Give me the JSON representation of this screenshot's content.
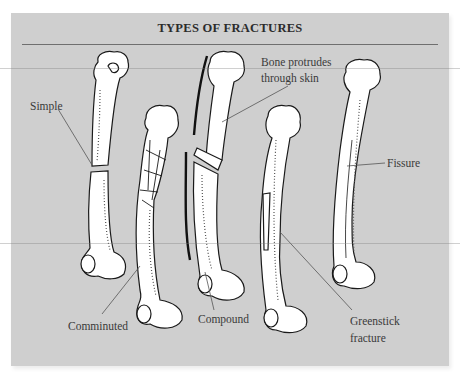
{
  "figure": {
    "title": "TYPES OF FRACTURES",
    "background_color": "#cfcfcf",
    "bone_color": "#ffffff",
    "ink_color": "#1a1a1a"
  },
  "labels": {
    "simple": "Simple",
    "comminuted": "Comminuted",
    "compound": "Compound",
    "bone_protrudes_line1": "Bone protrudes",
    "bone_protrudes_line2": "through skin",
    "greenstick_line1": "Greenstick",
    "greenstick_line2": "fracture",
    "fissure": "Fissure"
  },
  "bones": [
    {
      "id": "simple",
      "fracture": "Simple"
    },
    {
      "id": "comminuted",
      "fracture": "Comminuted"
    },
    {
      "id": "compound",
      "fracture": "Compound"
    },
    {
      "id": "greenstick",
      "fracture": "Greenstick fracture"
    },
    {
      "id": "fissure",
      "fracture": "Fissure"
    }
  ]
}
